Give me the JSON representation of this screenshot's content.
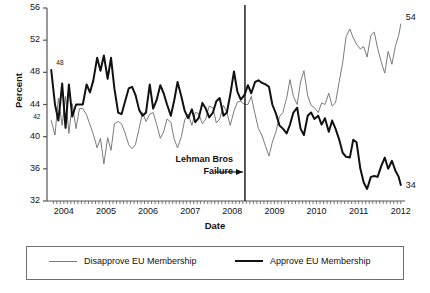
{
  "chart_data": {
    "type": "line",
    "title": "",
    "xlabel": "Date",
    "ylabel": "Percent",
    "ylim": [
      32,
      56
    ],
    "xlim": [
      2003.6,
      2012.1
    ],
    "yticks": [
      32,
      36,
      40,
      44,
      48,
      52,
      56
    ],
    "xticks": [
      2004,
      2005,
      2006,
      2007,
      2008,
      2009,
      2010,
      2011,
      2012
    ],
    "grid": false,
    "legend_position": "below-plot",
    "annotations": [
      {
        "name": "lehman-event",
        "text_line1": "Lehman Bros",
        "text_line2": "Failure",
        "x": 2008.3,
        "marker": "vertical-line-with-arrow"
      },
      {
        "name": "approve-start-label",
        "text": "48",
        "x": 2003.75,
        "y": 48
      },
      {
        "name": "disapprove-start-label",
        "text": "42",
        "x": 2003.7,
        "y": 42
      },
      {
        "name": "disapprove-end-label",
        "text": "54",
        "x": 2012.0,
        "y": 54
      },
      {
        "name": "approve-end-label",
        "text": "34",
        "x": 2012.0,
        "y": 34
      }
    ],
    "series": [
      {
        "name": "Disapprove EU Membership",
        "color": "#7b7b7b",
        "width": 1,
        "x": [
          2003.7,
          2003.79,
          2003.87,
          2003.96,
          2004.04,
          2004.12,
          2004.2,
          2004.29,
          2004.37,
          2004.45,
          2004.54,
          2004.62,
          2004.7,
          2004.79,
          2004.87,
          2004.95,
          2005.04,
          2005.12,
          2005.2,
          2005.29,
          2005.37,
          2005.45,
          2005.54,
          2005.62,
          2005.7,
          2005.79,
          2005.87,
          2005.95,
          2006.04,
          2006.12,
          2006.2,
          2006.29,
          2006.37,
          2006.45,
          2006.54,
          2006.62,
          2006.7,
          2006.79,
          2006.87,
          2006.95,
          2007.04,
          2007.12,
          2007.2,
          2007.29,
          2007.37,
          2007.45,
          2007.54,
          2007.62,
          2007.7,
          2007.79,
          2007.87,
          2007.95,
          2008.04,
          2008.12,
          2008.2,
          2008.29,
          2008.37,
          2008.45,
          2008.54,
          2008.62,
          2008.7,
          2008.79,
          2008.87,
          2008.95,
          2009.04,
          2009.12,
          2009.2,
          2009.29,
          2009.37,
          2009.45,
          2009.54,
          2009.62,
          2009.7,
          2009.79,
          2009.87,
          2009.95,
          2010.04,
          2010.12,
          2010.2,
          2010.29,
          2010.37,
          2010.45,
          2010.54,
          2010.62,
          2010.7,
          2010.79,
          2010.87,
          2010.95,
          2011.04,
          2011.12,
          2011.2,
          2011.29,
          2011.37,
          2011.45,
          2011.54,
          2011.62,
          2011.7,
          2011.79,
          2011.87,
          2011.95,
          2012.0
        ],
        "y": [
          42.0,
          40.2,
          44.8,
          41.4,
          45.0,
          40.4,
          44.1,
          41.0,
          43.5,
          43.5,
          42.7,
          41.5,
          40.3,
          38.6,
          39.8,
          36.6,
          39.9,
          38.3,
          41.6,
          41.9,
          41.6,
          40.5,
          39.0,
          38.5,
          39.0,
          41.1,
          43.0,
          41.9,
          42.8,
          43.0,
          41.6,
          39.8,
          40.6,
          42.2,
          41.8,
          39.7,
          38.6,
          40.0,
          42.1,
          42.8,
          41.4,
          43.0,
          42.9,
          41.6,
          42.2,
          43.8,
          43.6,
          41.7,
          42.2,
          43.9,
          43.0,
          41.4,
          43.2,
          44.3,
          44.4,
          44.0,
          44.0,
          45.0,
          42.8,
          41.0,
          40.2,
          38.8,
          37.6,
          39.3,
          40.7,
          42.5,
          43.0,
          44.8,
          47.1,
          45.0,
          44.0,
          46.8,
          48.2,
          45.1,
          43.9,
          43.6,
          43.0,
          44.2,
          44.0,
          45.4,
          43.8,
          44.2,
          46.9,
          49.2,
          52.4,
          53.4,
          52.3,
          51.5,
          50.9,
          51.2,
          49.9,
          52.6,
          53.0,
          51.0,
          49.2,
          47.9,
          50.6,
          49.0,
          51.2,
          52.6,
          54.0
        ]
      },
      {
        "name": "Approve EU Membership",
        "color": "#111111",
        "width": 2,
        "x": [
          2003.7,
          2003.79,
          2003.87,
          2003.96,
          2004.04,
          2004.12,
          2004.2,
          2004.29,
          2004.37,
          2004.45,
          2004.54,
          2004.62,
          2004.7,
          2004.79,
          2004.87,
          2004.95,
          2005.04,
          2005.12,
          2005.2,
          2005.29,
          2005.37,
          2005.45,
          2005.54,
          2005.62,
          2005.7,
          2005.79,
          2005.87,
          2005.95,
          2006.04,
          2006.12,
          2006.2,
          2006.29,
          2006.37,
          2006.45,
          2006.54,
          2006.62,
          2006.7,
          2006.79,
          2006.87,
          2006.95,
          2007.04,
          2007.12,
          2007.2,
          2007.29,
          2007.37,
          2007.45,
          2007.54,
          2007.62,
          2007.7,
          2007.79,
          2007.87,
          2007.95,
          2008.04,
          2008.12,
          2008.2,
          2008.29,
          2008.37,
          2008.45,
          2008.54,
          2008.62,
          2008.7,
          2008.79,
          2008.87,
          2008.95,
          2009.04,
          2009.12,
          2009.2,
          2009.29,
          2009.37,
          2009.45,
          2009.54,
          2009.62,
          2009.7,
          2009.79,
          2009.87,
          2009.95,
          2010.04,
          2010.12,
          2010.2,
          2010.29,
          2010.37,
          2010.45,
          2010.54,
          2010.62,
          2010.7,
          2010.79,
          2010.87,
          2010.95,
          2011.04,
          2011.12,
          2011.2,
          2011.29,
          2011.37,
          2011.45,
          2011.54,
          2011.62,
          2011.7,
          2011.79,
          2011.87,
          2011.95,
          2012.0
        ],
        "y": [
          48.3,
          44.0,
          42.0,
          46.6,
          41.1,
          46.5,
          42.5,
          44.0,
          44.0,
          44.0,
          46.5,
          45.5,
          47.0,
          49.8,
          48.2,
          50.1,
          47.2,
          49.8,
          46.0,
          43.0,
          42.8,
          44.3,
          46.0,
          46.2,
          45.2,
          43.3,
          42.6,
          43.0,
          46.5,
          43.5,
          44.5,
          46.4,
          45.4,
          44.0,
          42.6,
          44.5,
          46.8,
          45.0,
          43.2,
          42.3,
          43.4,
          41.8,
          42.3,
          44.2,
          43.5,
          42.4,
          43.0,
          44.4,
          44.8,
          42.6,
          43.0,
          45.2,
          48.1,
          45.6,
          44.6,
          45.2,
          46.4,
          45.4,
          46.8,
          47.0,
          46.7,
          46.5,
          46.2,
          44.0,
          42.8,
          41.4,
          41.0,
          40.4,
          41.5,
          43.0,
          43.6,
          41.0,
          40.2,
          42.6,
          43.0,
          42.2,
          42.6,
          41.5,
          42.3,
          40.6,
          42.0,
          41.0,
          39.6,
          38.0,
          37.5,
          37.4,
          39.6,
          39.3,
          36.0,
          34.3,
          33.5,
          35.0,
          35.1,
          35.0,
          36.4,
          37.4,
          36.0,
          37.0,
          35.8,
          35.0,
          34.0
        ]
      }
    ]
  },
  "legend": {
    "entries": [
      {
        "label": "Disapprove EU Membership",
        "style": "gray-thin-line"
      },
      {
        "label": "Approve EU Membership",
        "style": "black-thick-line"
      }
    ]
  }
}
